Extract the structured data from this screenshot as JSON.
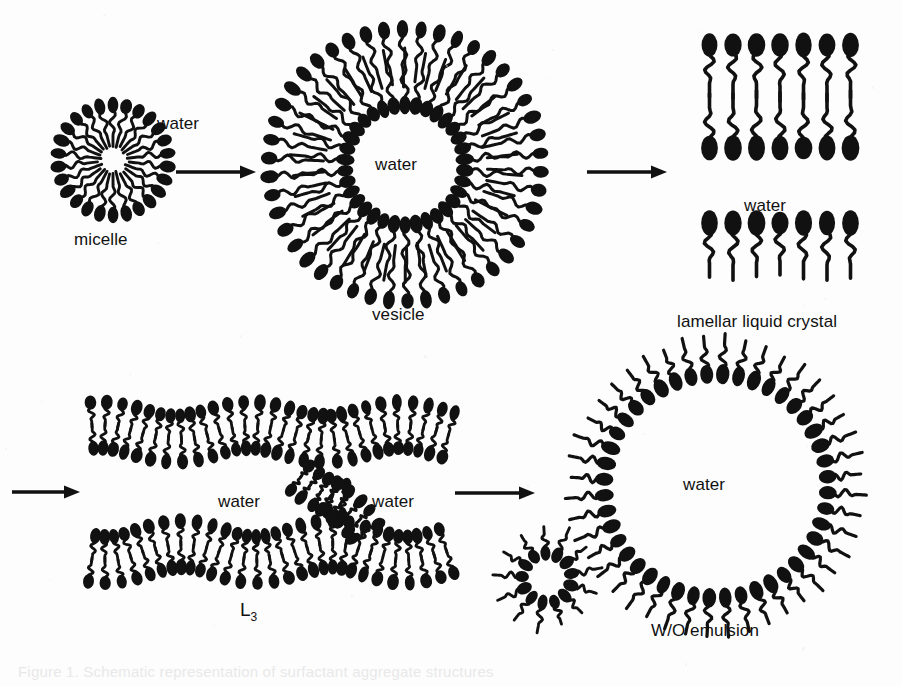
{
  "figure": {
    "kind": "scientific-diagram",
    "background_color": "#fdfdfd",
    "ink_color": "#111111",
    "width": 902,
    "height": 687
  },
  "labels": {
    "micelle": "micelle",
    "vesicle": "vesicle",
    "lamellar": "lamellar liquid crystal",
    "l3_base": "L",
    "l3_sub": "3",
    "wo_emulsion": "W/O emulsion",
    "water_micelle": "water",
    "water_vesicle": "water",
    "water_lamellar": "water",
    "water_l3_left": "water",
    "water_l3_right": "water",
    "water_emulsion": "water"
  },
  "caption": {
    "ghost_text": "Figure 1. Schematic representation of surfactant aggregate structures"
  },
  "structures": [
    {
      "id": "micelle",
      "label": "micelle",
      "row": 1,
      "order": 1,
      "center": [
        113,
        160
      ],
      "type": "normal-micelle",
      "head_orientation": "outward",
      "tail_orientation": "inward",
      "molecule_count": 26,
      "outer_radius": 55,
      "core_radius": 17,
      "interior": "hydrocarbon tails",
      "exterior": "water"
    },
    {
      "id": "vesicle",
      "label": "vesicle",
      "row": 1,
      "order": 2,
      "center": [
        405,
        165
      ],
      "type": "bilayer-vesicle",
      "head_orientation": "outward and inward (bilayer)",
      "molecule_count_outer": 46,
      "molecule_count_inner": 34,
      "outer_radius": 136,
      "inner_radius": 60,
      "interior": "water",
      "exterior": "water"
    },
    {
      "id": "lamellar",
      "label": "lamellar liquid crystal",
      "row": 1,
      "order": 3,
      "center": [
        780,
        165
      ],
      "type": "lamellar-stack",
      "bilayer_count": 2,
      "molecules_per_row": 7,
      "row_spacing": 8,
      "interlayer_medium": "water",
      "description": "stacked bilayers separated by water"
    },
    {
      "id": "l3",
      "label": "L3",
      "row": 2,
      "order": 1,
      "center": [
        252,
        492
      ],
      "type": "sponge-phase",
      "bilayer_count": 2,
      "connected": true,
      "water_regions": 2,
      "description": "two undulating bilayers with a connecting passage"
    },
    {
      "id": "reverse-micelle",
      "label": "",
      "row": 2,
      "order": 2,
      "center": [
        547,
        578
      ],
      "type": "reverse-micelle",
      "head_orientation": "inward",
      "tail_orientation": "outward",
      "molecule_count": 13,
      "outer_radius": 25,
      "interior": "water",
      "exterior": "oil"
    },
    {
      "id": "wo-emulsion",
      "label": "W/O emulsion",
      "row": 2,
      "order": 3,
      "center": [
        716,
        486
      ],
      "type": "water-in-oil-droplet",
      "head_orientation": "inward",
      "tail_orientation": "outward",
      "molecule_count": 44,
      "droplet_radius": 112,
      "interior": "water",
      "exterior": "oil"
    }
  ],
  "arrows": [
    {
      "id": "arrow-micelle-vesicle",
      "from": "micelle",
      "to": "vesicle",
      "x1": 176,
      "y1": 172,
      "x2": 256,
      "y2": 172,
      "direction": "right"
    },
    {
      "id": "arrow-vesicle-lamellar",
      "from": "vesicle",
      "to": "lamellar",
      "x1": 587,
      "y1": 172,
      "x2": 667,
      "y2": 172,
      "direction": "right"
    },
    {
      "id": "arrow-wrap-to-l3",
      "from": "lamellar",
      "to": "l3",
      "x1": 12,
      "y1": 492,
      "x2": 80,
      "y2": 492,
      "direction": "right"
    },
    {
      "id": "arrow-l3-emulsion",
      "from": "l3",
      "to": "wo-emulsion",
      "x1": 455,
      "y1": 493,
      "x2": 535,
      "y2": 493,
      "direction": "right"
    }
  ],
  "label_positions": {
    "water_micelle": {
      "x": 157,
      "y": 115
    },
    "micelle": {
      "x": 74,
      "y": 231
    },
    "water_vesicle": {
      "x": 375,
      "y": 156
    },
    "vesicle": {
      "x": 372,
      "y": 306
    },
    "water_lamellar": {
      "x": 744,
      "y": 197
    },
    "lamellar": {
      "x": 677,
      "y": 313
    },
    "water_l3_left": {
      "x": 218,
      "y": 493
    },
    "water_l3_right": {
      "x": 372,
      "y": 493
    },
    "l3": {
      "x": 240,
      "y": 600
    },
    "water_emulsion": {
      "x": 683,
      "y": 476
    },
    "wo_emulsion": {
      "x": 651,
      "y": 622
    }
  }
}
